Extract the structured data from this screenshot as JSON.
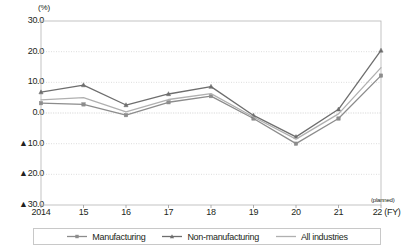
{
  "chart_data": {
    "type": "line",
    "title": "",
    "subtitle": "",
    "xlabel": "(FY)",
    "ylabel": "(%)",
    "unit_label": "(%)",
    "x": [
      "2014",
      "15",
      "16",
      "17",
      "18",
      "19",
      "20",
      "21",
      "22"
    ],
    "x_tick_labels": [
      "2014",
      "15",
      "16",
      "17",
      "18",
      "19",
      "20",
      "21",
      "22 (FY)"
    ],
    "y_tick_labels": [
      "30.0",
      "20.0",
      "10.0",
      "0.0",
      "▲10.0",
      "▲20.0",
      "▲30.0"
    ],
    "y_tick_values": [
      30.0,
      20.0,
      10.0,
      0.0,
      -10.0,
      -20.0,
      -30.0
    ],
    "ylim": [
      -30.0,
      30.0
    ],
    "grid": true,
    "grid_axis": "y",
    "legend_position": "bottom",
    "annotations": [
      "(planned)"
    ],
    "series": [
      {
        "name": "Manufacturing",
        "marker": "square",
        "color": "#8c8c8c",
        "values": [
          3.2,
          2.8,
          -0.7,
          3.5,
          5.5,
          -1.8,
          -10.0,
          -1.8,
          12.2
        ]
      },
      {
        "name": "Non-manufacturing",
        "marker": "triangle",
        "color": "#6e6e6e",
        "values": [
          6.8,
          9.1,
          2.6,
          6.2,
          8.6,
          -0.8,
          -7.8,
          1.2,
          20.4
        ]
      },
      {
        "name": "All industries",
        "marker": "none",
        "color": "#b0b0b0",
        "values": [
          4.3,
          5.0,
          0.4,
          4.4,
          6.3,
          -1.3,
          -8.5,
          -0.3,
          14.8
        ]
      }
    ]
  },
  "legend": {
    "items": [
      {
        "label": "Manufacturing"
      },
      {
        "label": "Non-manufacturing"
      },
      {
        "label": "All industries"
      }
    ]
  }
}
